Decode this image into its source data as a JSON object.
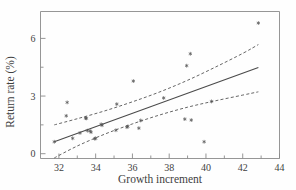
{
  "figure": {
    "background": "#fefefe",
    "ink_color": "#4a4a4a"
  },
  "chart_data": {
    "type": "scatter",
    "title": "",
    "subtitle": "",
    "xlabel": "Growth increment",
    "ylabel": "Return rate (%)",
    "xlim": [
      31.0,
      44.0
    ],
    "ylim": [
      -0.25,
      7.4
    ],
    "grid": false,
    "legend": null,
    "x_ticks_major": [
      32,
      34,
      36,
      38,
      40,
      42,
      44
    ],
    "x_tick_labels": [
      "32",
      "34",
      "36",
      "38",
      "40",
      "42",
      "44"
    ],
    "x_ticks_minor": [
      33,
      35,
      37,
      39,
      41,
      43
    ],
    "y_ticks_major": [
      0,
      3,
      6
    ],
    "y_tick_labels": [
      "0",
      "3",
      "6"
    ],
    "y_ticks_minor": [
      1.5,
      4.5
    ],
    "marker_style": "asterisk",
    "points": [
      {
        "x": 31.75,
        "y": 0.62
      },
      {
        "x": 32.45,
        "y": 2.67
      },
      {
        "x": 32.4,
        "y": 1.97
      },
      {
        "x": 32.75,
        "y": 0.8
      },
      {
        "x": 33.15,
        "y": 1.08
      },
      {
        "x": 33.45,
        "y": 1.85
      },
      {
        "x": 33.5,
        "y": 1.84
      },
      {
        "x": 33.55,
        "y": 1.2
      },
      {
        "x": 33.7,
        "y": 1.18
      },
      {
        "x": 33.75,
        "y": 1.12
      },
      {
        "x": 33.95,
        "y": 0.78
      },
      {
        "x": 34.0,
        "y": 0.8
      },
      {
        "x": 34.3,
        "y": 1.53
      },
      {
        "x": 34.35,
        "y": 1.48
      },
      {
        "x": 35.1,
        "y": 1.22
      },
      {
        "x": 35.15,
        "y": 2.58
      },
      {
        "x": 35.7,
        "y": 1.38
      },
      {
        "x": 35.75,
        "y": 1.42
      },
      {
        "x": 36.05,
        "y": 3.78
      },
      {
        "x": 36.35,
        "y": 1.33
      },
      {
        "x": 36.45,
        "y": 1.73
      },
      {
        "x": 37.7,
        "y": 2.9
      },
      {
        "x": 38.85,
        "y": 1.8
      },
      {
        "x": 38.95,
        "y": 4.58
      },
      {
        "x": 39.15,
        "y": 5.2
      },
      {
        "x": 39.2,
        "y": 1.75
      },
      {
        "x": 39.9,
        "y": 0.62
      },
      {
        "x": 40.3,
        "y": 2.72
      },
      {
        "x": 42.85,
        "y": 6.8
      }
    ],
    "fit_line": {
      "style": "solid",
      "label": "regression line",
      "x_start": 31.75,
      "x_end": 42.85,
      "y_start": 0.62,
      "y_end": 4.48
    },
    "confidence_bands": {
      "style": "dashed",
      "label": "95% confidence band",
      "upper": [
        {
          "x": 31.75,
          "y": 1.5
        },
        {
          "x": 33.0,
          "y": 1.82
        },
        {
          "x": 34.5,
          "y": 2.23
        },
        {
          "x": 36.0,
          "y": 2.7
        },
        {
          "x": 37.5,
          "y": 3.22
        },
        {
          "x": 39.0,
          "y": 3.82
        },
        {
          "x": 40.5,
          "y": 4.5
        },
        {
          "x": 42.0,
          "y": 5.22
        },
        {
          "x": 42.85,
          "y": 5.68
        }
      ],
      "lower": [
        {
          "x": 31.75,
          "y": -0.22
        },
        {
          "x": 33.0,
          "y": 0.4
        },
        {
          "x": 34.5,
          "y": 1.02
        },
        {
          "x": 36.0,
          "y": 1.55
        },
        {
          "x": 37.5,
          "y": 2.02
        },
        {
          "x": 39.0,
          "y": 2.42
        },
        {
          "x": 40.5,
          "y": 2.75
        },
        {
          "x": 42.0,
          "y": 3.05
        },
        {
          "x": 42.85,
          "y": 3.22
        }
      ]
    }
  }
}
